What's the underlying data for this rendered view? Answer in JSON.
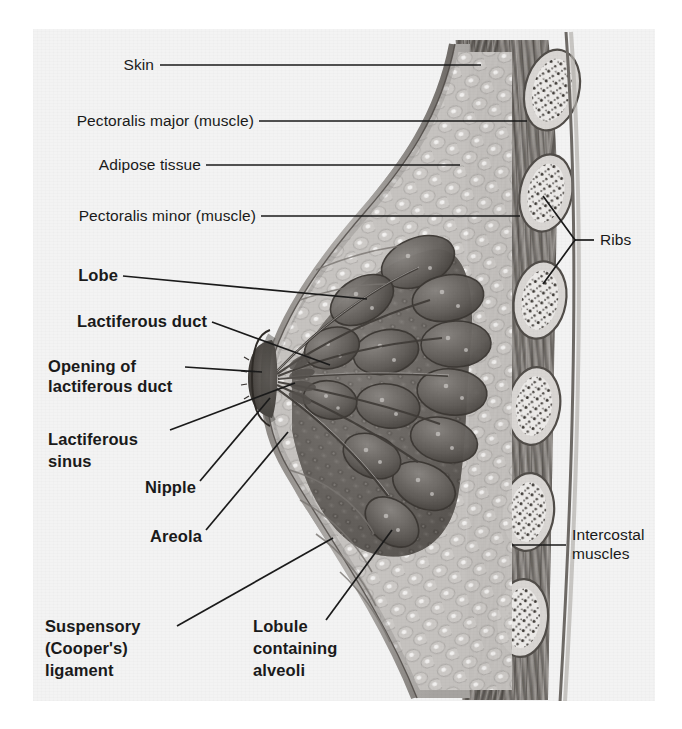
{
  "figure": {
    "style": "grayscale halftone medical illustration on scanned page",
    "background_color": "#f3f3f3",
    "ink_color": "#1a1a1a"
  },
  "labels": {
    "skin": {
      "text": "Skin",
      "weight": "regular"
    },
    "pec_major": {
      "text": "Pectoralis major (muscle)",
      "weight": "regular"
    },
    "adipose": {
      "text": "Adipose tissue",
      "weight": "regular"
    },
    "pec_minor": {
      "text": "Pectoralis minor (muscle)",
      "weight": "regular"
    },
    "ribs": {
      "text": "Ribs",
      "weight": "regular"
    },
    "intercostal_l1": {
      "text": "Intercostal",
      "weight": "regular"
    },
    "intercostal_l2": {
      "text": "muscles",
      "weight": "regular"
    },
    "lobe": {
      "text": "Lobe",
      "weight": "bold"
    },
    "lact_duct": {
      "text": "Lactiferous duct",
      "weight": "bold"
    },
    "opening_l1": {
      "text": "Opening of",
      "weight": "bold"
    },
    "opening_l2": {
      "text": "lactiferous duct",
      "weight": "bold"
    },
    "sinus_l1": {
      "text": "Lactiferous",
      "weight": "bold"
    },
    "sinus_l2": {
      "text": "sinus",
      "weight": "bold"
    },
    "nipple": {
      "text": "Nipple",
      "weight": "bold"
    },
    "areola": {
      "text": "Areola",
      "weight": "bold"
    },
    "suspensory_l1": {
      "text": "Suspensory",
      "weight": "bold"
    },
    "suspensory_l2": {
      "text": "(Cooper's)",
      "weight": "bold"
    },
    "suspensory_l3": {
      "text": "ligament",
      "weight": "bold"
    },
    "lobule_l1": {
      "text": "Lobule",
      "weight": "bold"
    },
    "lobule_l2": {
      "text": "containing",
      "weight": "bold"
    },
    "lobule_l3": {
      "text": "alveoli",
      "weight": "bold"
    }
  }
}
